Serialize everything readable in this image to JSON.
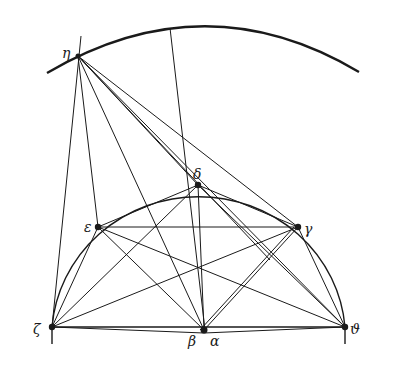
{
  "diagram": {
    "stroke_color": "#1a1a1a",
    "background": "#ffffff",
    "points": {
      "eta": {
        "label": "η",
        "x": 78,
        "y": 56,
        "lx": 62,
        "ly": 58
      },
      "delta": {
        "label": "δ",
        "x": 198,
        "y": 185,
        "lx": 193,
        "ly": 178
      },
      "epsilon": {
        "label": "ε",
        "x": 98,
        "y": 227,
        "lx": 84,
        "ly": 232
      },
      "gamma": {
        "label": "γ",
        "x": 298,
        "y": 227,
        "lx": 304,
        "ly": 234
      },
      "zeta": {
        "label": "ζ",
        "x": 52,
        "y": 327,
        "lx": 33,
        "ly": 334
      },
      "theta": {
        "label": "ϑ",
        "x": 345,
        "y": 327,
        "lx": 350,
        "ly": 334
      },
      "beta": {
        "label": "β",
        "x": 202,
        "y": 330,
        "lx": 188,
        "ly": 346
      },
      "alpha": {
        "label": "α",
        "x": 207,
        "y": 330,
        "lx": 210,
        "ly": 346
      }
    }
  }
}
